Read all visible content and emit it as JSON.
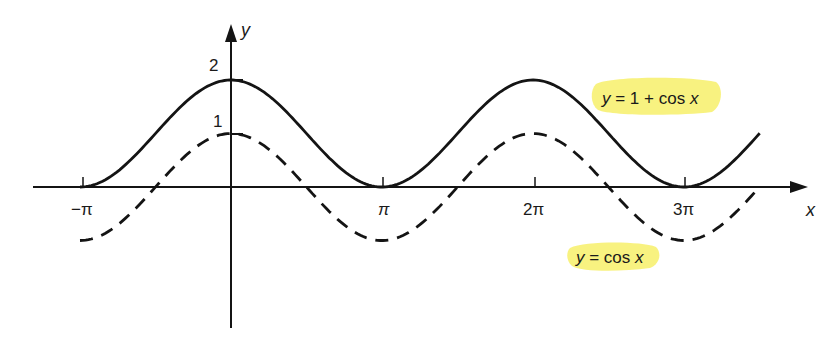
{
  "chart_data": {
    "type": "line",
    "title": "",
    "xlabel": "x",
    "ylabel": "y",
    "x_ticks": [
      {
        "value": -3.14159,
        "label": "−π"
      },
      {
        "value": 3.14159,
        "label": "π"
      },
      {
        "value": 6.28319,
        "label": "2π"
      },
      {
        "value": 9.42478,
        "label": "3π"
      }
    ],
    "y_ticks": [
      {
        "value": 1,
        "label": "1"
      },
      {
        "value": 2,
        "label": "2"
      }
    ],
    "xlim": [
      -4.2,
      11.8
    ],
    "ylim": [
      -2.6,
      3.0
    ],
    "grid": false,
    "legend": "inline annotations",
    "series": [
      {
        "name": "y = 1 + cos x",
        "style": "solid",
        "function": "1 + cos(x)",
        "x_range": [
          -3.14159,
          11.0
        ],
        "x": [
          -3.14159,
          -1.5708,
          0,
          1.5708,
          3.14159,
          4.7124,
          6.28319,
          7.85398,
          9.42478,
          11.0
        ],
        "values": [
          0,
          1,
          2,
          1,
          0,
          1,
          2,
          1,
          0,
          1
        ]
      },
      {
        "name": "y = cos x",
        "style": "dashed",
        "function": "cos(x)",
        "x_range": [
          -3.14159,
          11.0
        ],
        "x": [
          -3.14159,
          -1.5708,
          0,
          1.5708,
          3.14159,
          4.7124,
          6.28319,
          7.85398,
          9.42478,
          11.0
        ],
        "values": [
          -1,
          0,
          1,
          0,
          -1,
          0,
          1,
          0,
          -1,
          0
        ]
      }
    ],
    "annotations": [
      {
        "text": "y = 1 + cos x",
        "highlight": "#f7f06a",
        "attached_to": "solid"
      },
      {
        "text": "y = cos x",
        "highlight": "#f7f06a",
        "attached_to": "dashed"
      }
    ]
  },
  "labels": {
    "x_axis": "x",
    "y_axis": "y",
    "tick_neg_pi": "−π",
    "tick_pi": "π",
    "tick_2pi": "2π",
    "tick_3pi": "3π",
    "tick_y1": "1",
    "tick_y2": "2",
    "eq_solid_y": "y",
    "eq_solid_rest": " = 1 + cos ",
    "eq_solid_x": "x",
    "eq_dashed_y": "y",
    "eq_dashed_rest": " = cos ",
    "eq_dashed_x": "x"
  },
  "colors": {
    "ink": "#141414",
    "highlight": "#f7f06a",
    "background": "#ffffff"
  }
}
